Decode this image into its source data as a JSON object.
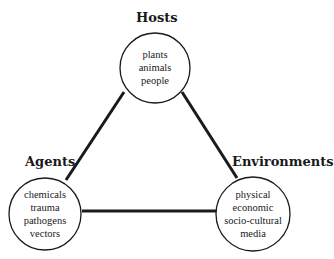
{
  "diagram": {
    "type": "triangle",
    "nodes": [
      {
        "id": "hosts",
        "title": "Hosts",
        "items": [
          "plants",
          "animals",
          "people"
        ]
      },
      {
        "id": "agents",
        "title": "Agents",
        "items": [
          "chemicals",
          "trauma",
          "pathogens",
          "vectors"
        ]
      },
      {
        "id": "environments",
        "title": "Environments",
        "items": [
          "physical",
          "economic",
          "socio-cultural",
          "media"
        ]
      }
    ],
    "edges": [
      {
        "from": "hosts",
        "to": "agents"
      },
      {
        "from": "hosts",
        "to": "environments"
      },
      {
        "from": "agents",
        "to": "environments"
      }
    ],
    "colors": {
      "line": "#1a1a1a",
      "circle_fill": "#ffffff",
      "background": "#ffffff"
    }
  }
}
